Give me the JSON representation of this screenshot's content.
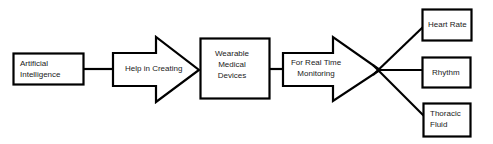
{
  "diagram": {
    "type": "flowchart",
    "nodes": {
      "ai": {
        "label_line1": "Artificial",
        "label_line2": "Intelligence",
        "shape": "rectangle"
      },
      "help": {
        "label": "Help in Creating",
        "shape": "block-arrow"
      },
      "wearable": {
        "label_line1": "Wearable",
        "label_line2": "Medical",
        "label_line3": "Devices",
        "shape": "rectangle"
      },
      "monitoring": {
        "label_line1": "For Real Time",
        "label_line2": "Monitoring",
        "shape": "block-arrow"
      },
      "heart_rate": {
        "label": "Heart Rate",
        "shape": "rectangle"
      },
      "rhythm": {
        "label": "Rhythm",
        "shape": "rectangle"
      },
      "thoracic": {
        "label_line1": "Thoracic",
        "label_line2": "Fluid",
        "shape": "rectangle"
      }
    },
    "edges": [
      {
        "from": "ai",
        "to": "help"
      },
      {
        "from": "help",
        "to": "wearable"
      },
      {
        "from": "wearable",
        "to": "monitoring"
      },
      {
        "from": "monitoring",
        "to": "heart_rate"
      },
      {
        "from": "monitoring",
        "to": "rhythm"
      },
      {
        "from": "monitoring",
        "to": "thoracic"
      }
    ],
    "colors": {
      "stroke": "#000000",
      "fill": "#ffffff",
      "text": "#222222"
    }
  }
}
